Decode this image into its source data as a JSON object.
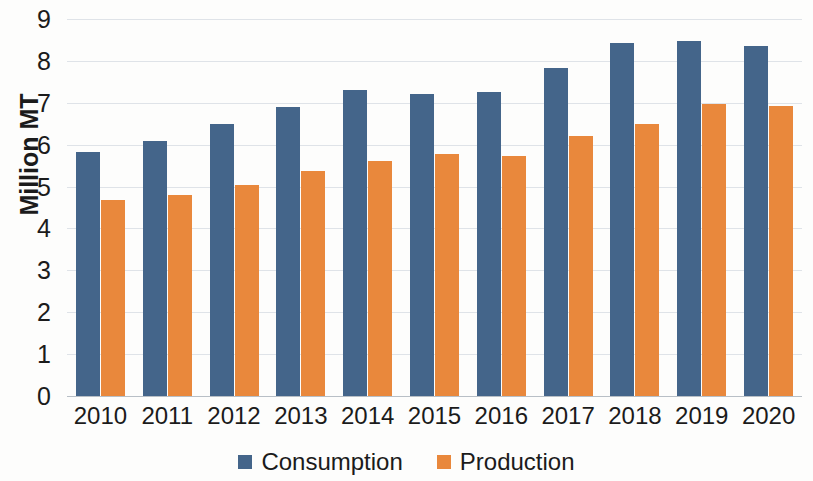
{
  "chart_data": {
    "type": "bar",
    "title": "",
    "subtitle": "",
    "xlabel": "",
    "ylabel": "Million MT",
    "ylim": [
      0,
      9
    ],
    "ytick_step": 1,
    "yticks": [
      0,
      1,
      2,
      3,
      4,
      5,
      6,
      7,
      8,
      9
    ],
    "grid": true,
    "grid_axis": "y",
    "legend_position": "bottom-center",
    "categories": [
      "2010",
      "2011",
      "2012",
      "2013",
      "2014",
      "2015",
      "2016",
      "2017",
      "2018",
      "2019",
      "2020"
    ],
    "series": [
      {
        "name": "Consumption",
        "color": "#44658a",
        "values": [
          5.82,
          6.08,
          6.5,
          6.9,
          7.3,
          7.22,
          7.25,
          7.83,
          8.42,
          8.48,
          8.35
        ]
      },
      {
        "name": "Production",
        "color": "#e9883c",
        "values": [
          4.68,
          4.8,
          5.03,
          5.37,
          5.6,
          5.78,
          5.72,
          6.2,
          6.5,
          6.98,
          6.93
        ]
      }
    ]
  },
  "legend": {
    "items": [
      {
        "label": "Consumption",
        "color": "#44658a"
      },
      {
        "label": "Production",
        "color": "#e9883c"
      }
    ]
  },
  "axes": {
    "y_title": "Million MT"
  }
}
